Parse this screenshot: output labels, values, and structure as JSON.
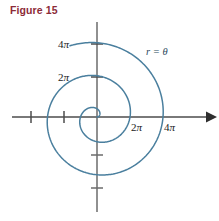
{
  "figure": {
    "title": "Figure 15",
    "title_color": "#8c2b38"
  },
  "chart_data": {
    "type": "line",
    "title": "Figure 15",
    "subtitle": "",
    "plot_kind": "polar-spiral",
    "equation_label": "r = θ",
    "equation_label_color": "#2b4a5e",
    "curve_color": "#4a7f9e",
    "axis_color": "#4d4d4d",
    "xlabel": "",
    "ylabel": "",
    "x_tick_labels": [
      "2π",
      "4π"
    ],
    "y_tick_labels": [
      "2π",
      "4π"
    ],
    "x_tick_values": [
      6.283185,
      12.566371
    ],
    "y_tick_values": [
      6.283185,
      12.566371
    ],
    "unlabeled_x_ticks": [
      -6.283185,
      -12.566371
    ],
    "unlabeled_y_ticks": [
      -6.283185,
      -12.566371
    ],
    "xlim": [
      -16.5,
      16.5
    ],
    "ylim": [
      -16.5,
      16.5
    ],
    "grid": false,
    "legend": "none",
    "theta_range": [
      0,
      14.5
    ],
    "series": [
      {
        "name": "r = θ",
        "polar": true,
        "points": [
          {
            "theta": 0.0,
            "r": 0.0
          },
          {
            "theta": 0.7854,
            "r": 0.7854
          },
          {
            "theta": 1.5708,
            "r": 1.5708
          },
          {
            "theta": 2.3562,
            "r": 2.3562
          },
          {
            "theta": 3.1416,
            "r": 3.1416
          },
          {
            "theta": 3.927,
            "r": 3.927
          },
          {
            "theta": 4.7124,
            "r": 4.7124
          },
          {
            "theta": 5.4978,
            "r": 5.4978
          },
          {
            "theta": 6.2832,
            "r": 6.2832
          },
          {
            "theta": 7.0686,
            "r": 7.0686
          },
          {
            "theta": 7.854,
            "r": 7.854
          },
          {
            "theta": 8.6394,
            "r": 8.6394
          },
          {
            "theta": 9.4248,
            "r": 9.4248
          },
          {
            "theta": 10.2102,
            "r": 10.2102
          },
          {
            "theta": 10.9956,
            "r": 10.9956
          },
          {
            "theta": 11.781,
            "r": 11.781
          },
          {
            "theta": 12.5664,
            "r": 12.5664
          },
          {
            "theta": 13.3518,
            "r": 13.3518
          },
          {
            "theta": 14.1372,
            "r": 14.1372
          },
          {
            "theta": 14.5,
            "r": 14.5
          }
        ]
      }
    ],
    "annotations": [
      {
        "name": "x-axis-arrow",
        "text": ""
      },
      {
        "name": "equation",
        "text": "r = θ"
      }
    ]
  }
}
